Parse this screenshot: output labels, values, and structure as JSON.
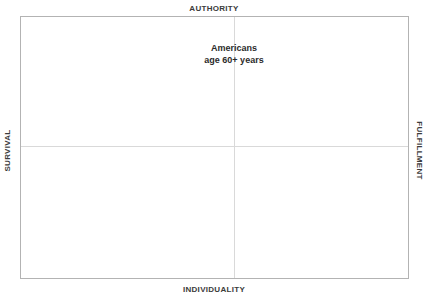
{
  "chart_data": {
    "type": "scatter",
    "title": "",
    "subtitle": "",
    "xlabel": "",
    "ylabel": "",
    "grid": false,
    "legend": "none",
    "axis_poles": {
      "top": "AUTHORITY",
      "bottom": "INDIVIDUALITY",
      "left": "SURVIVAL",
      "right": "FULFILLMENT"
    },
    "x_axis": {
      "negative_pole": "SURVIVAL",
      "positive_pole": "FULFILLMENT",
      "crosshair_position_fraction": 0.55
    },
    "y_axis": {
      "negative_pole": "INDIVIDUALITY",
      "positive_pole": "AUTHORITY",
      "crosshair_position_fraction": 0.505
    },
    "annotations": [
      {
        "name": "americans-age-60-plus",
        "lines": [
          "Americans",
          "age 60+ years"
        ],
        "x_fraction": 0.55,
        "y_fraction": 0.125
      }
    ],
    "series": [],
    "values": [],
    "categories": []
  },
  "frame": {
    "border_color": "#b3b3b3",
    "background_color": "#ffffff"
  },
  "axes": {
    "crosshair_color": "#d9d9d9",
    "vertical_label": "SURVIVAL",
    "horizontal_label": "AUTHORITY"
  },
  "labels": {
    "top": "AUTHORITY",
    "bottom": "INDIVIDUALITY",
    "left": "SURVIVAL",
    "right": "FULFILLMENT"
  },
  "annotation": {
    "line1": "Americans",
    "line2": "age 60+ years"
  },
  "colors": {
    "text": "#3b3b3b",
    "annotation_text": "#2b2b2b",
    "frame_border": "#b3b3b3",
    "crosshair": "#d9d9d9",
    "background": "#ffffff"
  }
}
